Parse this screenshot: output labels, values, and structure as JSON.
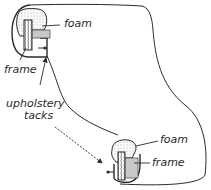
{
  "diagram": {
    "labels": {
      "top_foam": "foam",
      "top_frame": "frame",
      "tacks_line1": "upholstery",
      "tacks_line2": "tacks",
      "bottom_foam": "foam",
      "bottom_frame": "frame"
    },
    "colors": {
      "ink": "#2a2a2a",
      "fill_gray": "#c8c8c8",
      "foam_dots": "#8a8a8a",
      "background": "#ffffff"
    }
  }
}
